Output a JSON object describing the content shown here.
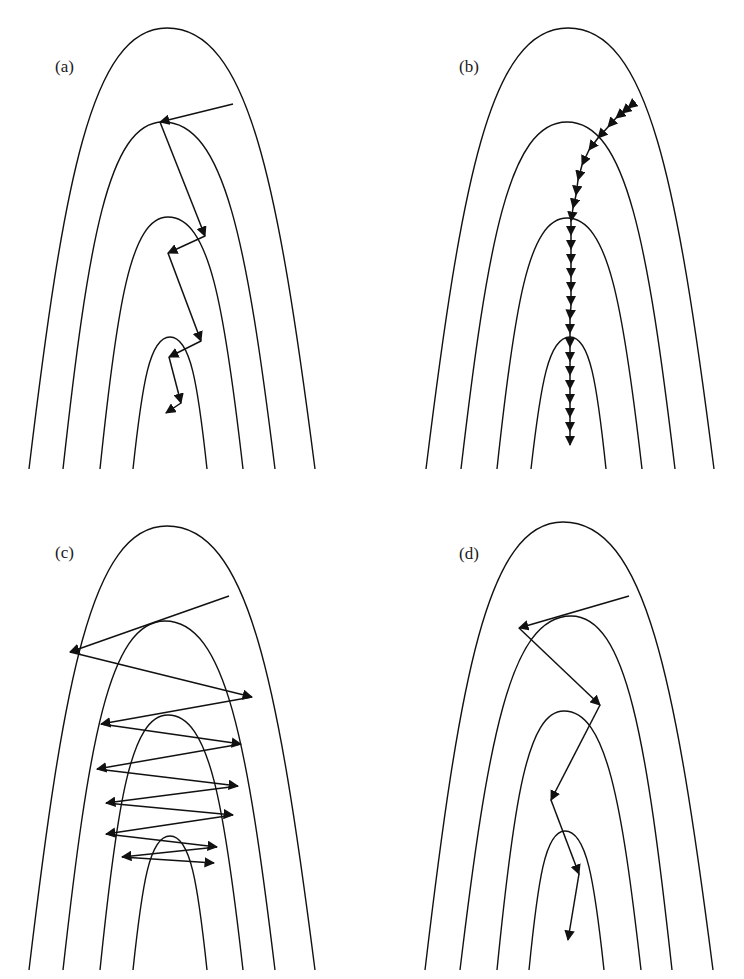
{
  "figure": {
    "stroke_color": "#111111",
    "background": "#ffffff"
  },
  "panels": [
    {
      "id": "a",
      "label": "(a)",
      "label_pos": [
        55,
        58
      ],
      "contours": [
        {
          "left_end": [
            29,
            469
          ],
          "apex": [
            167,
            28
          ],
          "right_end": [
            315,
            469
          ]
        },
        {
          "left_end": [
            63,
            469
          ],
          "apex": [
            163,
            122
          ],
          "right_end": [
            275,
            469
          ]
        },
        {
          "left_end": [
            100,
            469
          ],
          "apex": [
            168,
            217
          ],
          "right_end": [
            243,
            469
          ]
        },
        {
          "left_end": [
            133,
            469
          ],
          "apex": [
            170,
            337
          ],
          "right_end": [
            207,
            469
          ]
        }
      ],
      "trajectory_style": "moderate-steps",
      "trajectory": [
        [
          233,
          104
        ],
        [
          160,
          122
        ],
        [
          205,
          236
        ],
        [
          168,
          253
        ],
        [
          201,
          341
        ],
        [
          169,
          357
        ],
        [
          181,
          403
        ],
        [
          166,
          413
        ]
      ]
    },
    {
      "id": "b",
      "label": "(b)",
      "label_pos": [
        459,
        58
      ],
      "contours": [
        {
          "left_end": [
            426,
            469
          ],
          "apex": [
            568,
            28
          ],
          "right_end": [
            714,
            469
          ]
        },
        {
          "left_end": [
            461,
            469
          ],
          "apex": [
            567,
            122
          ],
          "right_end": [
            675,
            469
          ]
        },
        {
          "left_end": [
            497,
            469
          ],
          "apex": [
            567,
            218
          ],
          "right_end": [
            642,
            469
          ]
        },
        {
          "left_end": [
            531,
            469
          ],
          "apex": [
            570,
            337
          ],
          "right_end": [
            606,
            469
          ]
        }
      ],
      "trajectory_style": "tiny-steps",
      "trajectory": [
        [
          633,
          104
        ],
        [
          628,
          108
        ],
        [
          622,
          113
        ],
        [
          616,
          118
        ],
        [
          608,
          127
        ],
        [
          598,
          138
        ],
        [
          589,
          150
        ],
        [
          582,
          165
        ],
        [
          578,
          180
        ],
        [
          576,
          195
        ],
        [
          573,
          208
        ],
        [
          571,
          221
        ],
        [
          571,
          235
        ],
        [
          571,
          249
        ],
        [
          571,
          263
        ],
        [
          571,
          277
        ],
        [
          571,
          291
        ],
        [
          571,
          305
        ],
        [
          570,
          319
        ],
        [
          570,
          333
        ],
        [
          570,
          347
        ],
        [
          570,
          361
        ],
        [
          570,
          375
        ],
        [
          570,
          389
        ],
        [
          570,
          403
        ],
        [
          570,
          417
        ],
        [
          570,
          431
        ],
        [
          570,
          445
        ]
      ]
    },
    {
      "id": "c",
      "label": "(c)",
      "label_pos": [
        55,
        544
      ],
      "contours": [
        {
          "left_end": [
            29,
            970
          ],
          "apex": [
            167,
            526
          ],
          "right_end": [
            315,
            970
          ]
        },
        {
          "left_end": [
            63,
            970
          ],
          "apex": [
            165,
            621
          ],
          "right_end": [
            275,
            970
          ]
        },
        {
          "left_end": [
            100,
            970
          ],
          "apex": [
            168,
            715
          ],
          "right_end": [
            243,
            970
          ]
        },
        {
          "left_end": [
            133,
            970
          ],
          "apex": [
            170,
            836
          ],
          "right_end": [
            207,
            970
          ]
        }
      ],
      "trajectory_style": "oscillating-large-steps",
      "trajectory": [
        [
          229,
          596
        ],
        [
          70,
          652
        ],
        [
          252,
          697
        ],
        [
          101,
          724
        ],
        [
          241,
          744
        ],
        [
          97,
          769
        ],
        [
          238,
          786
        ],
        [
          106,
          803
        ],
        [
          233,
          815
        ],
        [
          106,
          834
        ],
        [
          217,
          847
        ],
        [
          122,
          857
        ],
        [
          214,
          863
        ]
      ]
    },
    {
      "id": "d",
      "label": "(d)",
      "label_pos": [
        459,
        545
      ],
      "contours": [
        {
          "left_end": [
            425,
            970
          ],
          "apex": [
            563,
            522
          ],
          "right_end": [
            713,
            970
          ]
        },
        {
          "left_end": [
            460,
            970
          ],
          "apex": [
            571,
            616
          ],
          "right_end": [
            672,
            970
          ]
        },
        {
          "left_end": [
            497,
            970
          ],
          "apex": [
            564,
            711
          ],
          "right_end": [
            641,
            970
          ]
        },
        {
          "left_end": [
            529,
            970
          ],
          "apex": [
            565,
            831
          ],
          "right_end": [
            604,
            970
          ]
        }
      ],
      "trajectory_style": "momentum-steps",
      "trajectory": [
        [
          629,
          596
        ],
        [
          519,
          628
        ],
        [
          600,
          705
        ],
        [
          551,
          800
        ],
        [
          579,
          874
        ],
        [
          568,
          940
        ]
      ]
    }
  ]
}
